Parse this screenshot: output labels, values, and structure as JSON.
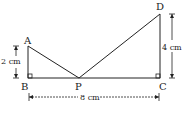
{
  "diagram": {
    "points": {
      "A": {
        "label": "A"
      },
      "B": {
        "label": "B"
      },
      "C": {
        "label": "C"
      },
      "D": {
        "label": "D"
      },
      "P": {
        "label": "P"
      }
    },
    "dimensions": {
      "AB": "2 cm",
      "DC": "4 cm",
      "BC": "8 cm"
    },
    "right_angles": [
      "B",
      "C"
    ],
    "colors": {
      "line": "#222222",
      "background": "#ffffff"
    }
  }
}
